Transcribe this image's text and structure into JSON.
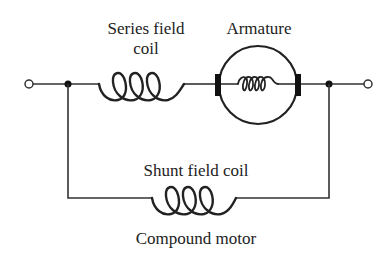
{
  "diagram": {
    "title": "Compound motor",
    "labels": {
      "series_field_line1": "Series field",
      "series_field_line2": "coil",
      "armature": "Armature",
      "shunt_field": "Shunt field coil",
      "caption": "Compound motor"
    },
    "components": [
      {
        "id": "left-terminal",
        "type": "terminal"
      },
      {
        "id": "left-junction",
        "type": "junction"
      },
      {
        "id": "series-field-coil",
        "type": "inductor",
        "label": "Series field coil"
      },
      {
        "id": "armature",
        "type": "motor-armature",
        "label": "Armature"
      },
      {
        "id": "right-junction",
        "type": "junction"
      },
      {
        "id": "right-terminal",
        "type": "terminal"
      },
      {
        "id": "shunt-field-coil",
        "type": "inductor",
        "label": "Shunt field coil"
      }
    ],
    "colors": {
      "line": "#333333",
      "text": "#222222",
      "background": "#ffffff"
    }
  }
}
